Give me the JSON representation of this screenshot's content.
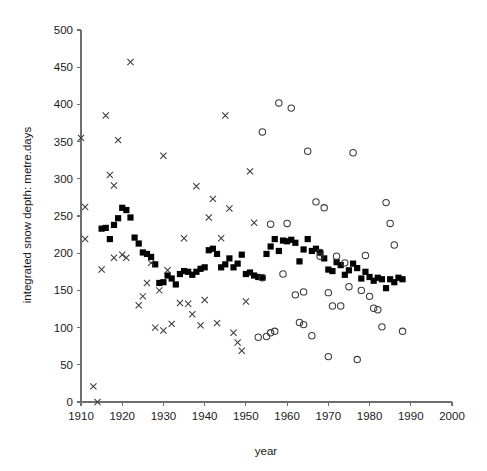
{
  "chart_data": {
    "type": "scatter",
    "title": "",
    "xlabel": "year",
    "ylabel": "integrated snow depth: metre.days",
    "xlim": [
      1910,
      2000
    ],
    "ylim": [
      0,
      500
    ],
    "xticks": [
      1910,
      1920,
      1930,
      1940,
      1950,
      1960,
      1970,
      1980,
      1990,
      2000
    ],
    "yticks": [
      0,
      50,
      100,
      150,
      200,
      250,
      300,
      350,
      400,
      450,
      500
    ],
    "grid": false,
    "legend": "none",
    "series": [
      {
        "name": "filled-square-series",
        "marker": "filled-square",
        "color": "#000000",
        "points": [
          [
            1915,
            233
          ],
          [
            1916,
            234
          ],
          [
            1917,
            219
          ],
          [
            1918,
            238
          ],
          [
            1919,
            247
          ],
          [
            1920,
            261
          ],
          [
            1921,
            258
          ],
          [
            1922,
            248
          ],
          [
            1923,
            221
          ],
          [
            1924,
            213
          ],
          [
            1925,
            201
          ],
          [
            1926,
            199
          ],
          [
            1927,
            195
          ],
          [
            1928,
            185
          ],
          [
            1929,
            160
          ],
          [
            1930,
            161
          ],
          [
            1931,
            170
          ],
          [
            1932,
            166
          ],
          [
            1933,
            158
          ],
          [
            1934,
            172
          ],
          [
            1935,
            176
          ],
          [
            1936,
            175
          ],
          [
            1937,
            171
          ],
          [
            1938,
            175
          ],
          [
            1939,
            179
          ],
          [
            1940,
            181
          ],
          [
            1941,
            204
          ],
          [
            1942,
            206
          ],
          [
            1943,
            199
          ],
          [
            1944,
            181
          ],
          [
            1945,
            185
          ],
          [
            1946,
            193
          ],
          [
            1947,
            181
          ],
          [
            1948,
            186
          ],
          [
            1949,
            198
          ],
          [
            1950,
            172
          ],
          [
            1951,
            174
          ],
          [
            1952,
            170
          ],
          [
            1953,
            168
          ],
          [
            1954,
            167
          ],
          [
            1955,
            199
          ],
          [
            1956,
            209
          ],
          [
            1957,
            219
          ],
          [
            1958,
            203
          ],
          [
            1959,
            217
          ],
          [
            1960,
            216
          ],
          [
            1961,
            218
          ],
          [
            1962,
            214
          ],
          [
            1963,
            189
          ],
          [
            1964,
            205
          ],
          [
            1965,
            219
          ],
          [
            1966,
            203
          ],
          [
            1967,
            206
          ],
          [
            1968,
            201
          ],
          [
            1969,
            193
          ],
          [
            1970,
            178
          ],
          [
            1971,
            176
          ],
          [
            1972,
            188
          ],
          [
            1973,
            184
          ],
          [
            1974,
            171
          ],
          [
            1975,
            177
          ],
          [
            1976,
            186
          ],
          [
            1977,
            180
          ],
          [
            1978,
            166
          ],
          [
            1979,
            175
          ],
          [
            1980,
            168
          ],
          [
            1981,
            163
          ],
          [
            1982,
            167
          ],
          [
            1983,
            165
          ],
          [
            1984,
            153
          ],
          [
            1985,
            165
          ],
          [
            1986,
            161
          ],
          [
            1987,
            167
          ],
          [
            1988,
            165
          ]
        ]
      },
      {
        "name": "cross-series",
        "marker": "cross",
        "color": "#3a3a3a",
        "points": [
          [
            1910,
            355
          ],
          [
            1911,
            262
          ],
          [
            1911,
            219
          ],
          [
            1913,
            21
          ],
          [
            1914,
            0
          ],
          [
            1915,
            178
          ],
          [
            1916,
            385
          ],
          [
            1917,
            305
          ],
          [
            1918,
            291
          ],
          [
            1918,
            194
          ],
          [
            1919,
            352
          ],
          [
            1920,
            198
          ],
          [
            1921,
            194
          ],
          [
            1922,
            457
          ],
          [
            1924,
            130
          ],
          [
            1925,
            142
          ],
          [
            1926,
            160
          ],
          [
            1927,
            187
          ],
          [
            1928,
            100
          ],
          [
            1929,
            150
          ],
          [
            1930,
            96
          ],
          [
            1930,
            331
          ],
          [
            1931,
            177
          ],
          [
            1932,
            105
          ],
          [
            1934,
            133
          ],
          [
            1935,
            220
          ],
          [
            1936,
            132
          ],
          [
            1937,
            118
          ],
          [
            1938,
            290
          ],
          [
            1939,
            103
          ],
          [
            1940,
            137
          ],
          [
            1941,
            248
          ],
          [
            1942,
            273
          ],
          [
            1943,
            106
          ],
          [
            1944,
            220
          ],
          [
            1945,
            385
          ],
          [
            1946,
            260
          ],
          [
            1947,
            93
          ],
          [
            1948,
            80
          ],
          [
            1949,
            69
          ],
          [
            1950,
            135
          ],
          [
            1951,
            310
          ],
          [
            1952,
            241
          ]
        ]
      },
      {
        "name": "open-circle-series",
        "marker": "open-circle",
        "color": "#3a3a3a",
        "points": [
          [
            1953,
            87
          ],
          [
            1954,
            167
          ],
          [
            1954,
            363
          ],
          [
            1955,
            88
          ],
          [
            1956,
            93
          ],
          [
            1956,
            239
          ],
          [
            1957,
            95
          ],
          [
            1958,
            402
          ],
          [
            1959,
            172
          ],
          [
            1960,
            240
          ],
          [
            1961,
            395
          ],
          [
            1962,
            144
          ],
          [
            1963,
            107
          ],
          [
            1964,
            148
          ],
          [
            1964,
            104
          ],
          [
            1965,
            337
          ],
          [
            1966,
            89
          ],
          [
            1967,
            269
          ],
          [
            1968,
            201
          ],
          [
            1968,
            196
          ],
          [
            1969,
            261
          ],
          [
            1970,
            147
          ],
          [
            1970,
            61
          ],
          [
            1971,
            129
          ],
          [
            1972,
            196
          ],
          [
            1973,
            129
          ],
          [
            1974,
            187
          ],
          [
            1975,
            155
          ],
          [
            1976,
            335
          ],
          [
            1977,
            57
          ],
          [
            1978,
            150
          ],
          [
            1979,
            197
          ],
          [
            1980,
            142
          ],
          [
            1981,
            126
          ],
          [
            1982,
            124
          ],
          [
            1983,
            101
          ],
          [
            1984,
            268
          ],
          [
            1985,
            240
          ],
          [
            1986,
            211
          ],
          [
            1988,
            95
          ]
        ]
      }
    ]
  },
  "axes": {
    "x_tick_labels": [
      "1910",
      "1920",
      "1930",
      "1940",
      "1950",
      "1960",
      "1970",
      "1980",
      "1990",
      "2000"
    ],
    "y_tick_labels": [
      "0",
      "50",
      "100",
      "150",
      "200",
      "250",
      "300",
      "350",
      "400",
      "450",
      "500"
    ],
    "x_title": "year",
    "y_title": "integrated snow depth: metre.days"
  },
  "style": {
    "axis_color": "#6e6e6e",
    "text_color": "#1a1a1a",
    "square_color": "#000000",
    "marker_outline_color": "#3a3a3a",
    "background": "#ffffff"
  }
}
